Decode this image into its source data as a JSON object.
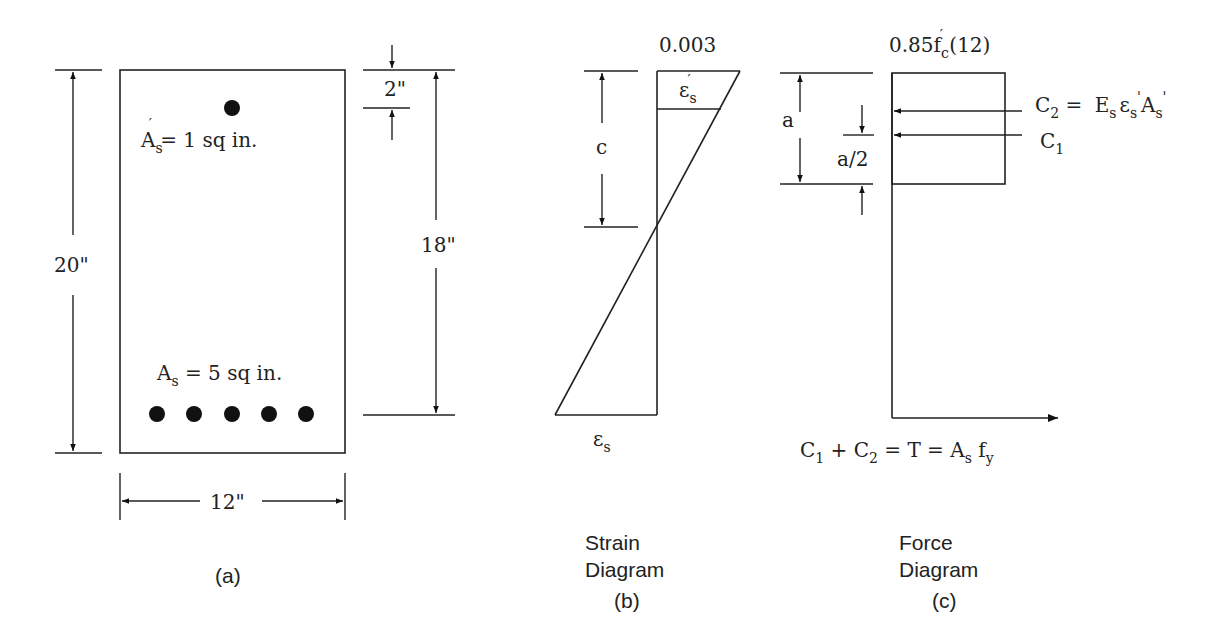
{
  "figure": {
    "panel_a": {
      "caption": "(a)",
      "width_label": "12\"",
      "height_label": "20\"",
      "depth_label": "18\"",
      "cover_label": "2\"",
      "top_steel": {
        "symbol": "A",
        "sub": "s",
        "prime": "′",
        "text": " = 1  sq  in."
      },
      "bottom_steel": {
        "symbol": "A",
        "sub": "s",
        "text": " = 5  sq  in."
      },
      "top_bar_count": 1,
      "bottom_bar_count": 5
    },
    "panel_b": {
      "caption": "(b)",
      "title_line1": "Strain",
      "title_line2": "Diagram",
      "top_strain": "0.003",
      "neutral_axis_label": "c",
      "comp_steel_strain": {
        "symbol": "ε",
        "sub": "s",
        "prime": "′"
      },
      "tension_steel_strain": {
        "symbol": "ε",
        "sub": "s"
      }
    },
    "panel_c": {
      "caption": "(c)",
      "title_line1": "Force",
      "title_line2": "Diagram",
      "stress_block_label": {
        "pre": "0.85f",
        "sub": "c",
        "prime": "′",
        "post": " (12)"
      },
      "depth_label": "a",
      "half_depth_label": "a/2",
      "c2_label": {
        "lhs": "C",
        "lhs_sub": "2",
        "eq": " =  ",
        "E": "E",
        "E_sub": "s",
        "eps": "ε",
        "eps_sub": "s",
        "A": "A",
        "A_sub": "s"
      },
      "c1_label": {
        "sym": "C",
        "sub": "1"
      },
      "equilibrium": {
        "c1": "C",
        "c1_sub": "1",
        "plus": " + ",
        "c2": "C",
        "c2_sub": "2",
        "rest": " =  T  =  A",
        "as_sub": "s",
        "fy": "  f",
        "fy_sub": "y"
      }
    }
  }
}
